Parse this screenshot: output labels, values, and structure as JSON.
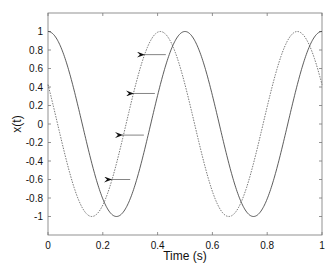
{
  "chart_data": {
    "type": "line",
    "title": "",
    "xlabel": "Time (s)",
    "ylabel": "x(t)",
    "xlim": [
      0,
      1
    ],
    "ylim": [
      -1.2,
      1.2
    ],
    "grid": false,
    "legend": null,
    "xticks": [
      0,
      0.2,
      0.4,
      0.6,
      0.8,
      1
    ],
    "xtick_labels": [
      "0",
      "0.2",
      "0.4",
      "0.6",
      "0.8",
      "1"
    ],
    "yticks": [
      1,
      0.8,
      0.6,
      0.4,
      0.2,
      0,
      -0.2,
      -0.4,
      -0.6,
      -0.8,
      -1
    ],
    "ytick_labels": [
      "1",
      "0.8",
      "0.6",
      "0.4",
      "0.2",
      "0",
      "-0.2",
      "-0.4",
      "-0.6",
      "-0.8",
      "-1"
    ],
    "series": [
      {
        "name": "x(t) original (solid)",
        "style": "solid",
        "formula": "cos(4*pi*t)",
        "frequency_hz": 2,
        "phase_shift_s": 0,
        "key_points": [
          [
            0,
            1
          ],
          [
            0.25,
            -1
          ],
          [
            0.5,
            1
          ],
          [
            0.75,
            -1
          ],
          [
            1,
            1
          ]
        ]
      },
      {
        "name": "x(t) shifted (dashed)",
        "style": "dashed",
        "formula": "cos(4*pi*(t - 0.41))",
        "frequency_hz": 2,
        "phase_shift_s": 0.41,
        "key_points": [
          [
            0,
            0.42
          ],
          [
            0.16,
            -1
          ],
          [
            0.41,
            1
          ],
          [
            0.66,
            -1
          ],
          [
            0.91,
            1
          ],
          [
            1,
            0.42
          ]
        ]
      }
    ],
    "annotations": [
      {
        "type": "arrow",
        "direction": "left",
        "y": 0.75,
        "from_x": 0.43,
        "to_x": 0.35
      },
      {
        "type": "arrow",
        "direction": "left",
        "y": 0.33,
        "from_x": 0.39,
        "to_x": 0.31
      },
      {
        "type": "arrow",
        "direction": "left",
        "y": -0.12,
        "from_x": 0.35,
        "to_x": 0.27
      },
      {
        "type": "arrow",
        "direction": "left",
        "y": -0.6,
        "from_x": 0.3,
        "to_x": 0.23
      }
    ]
  },
  "axes": {
    "xlabel": "Time (s)",
    "ylabel": "x(t)"
  }
}
